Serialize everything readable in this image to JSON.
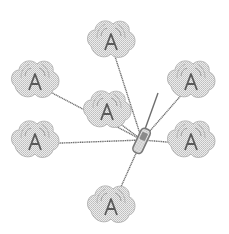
{
  "diagram": {
    "type": "star-network",
    "colors": {
      "background": "#ffffff",
      "line": "#6e6e6e",
      "node_fill": "#d4d4d4",
      "node_stroke": "#a8a8a8",
      "antenna": "#5a5a5a",
      "hub": "#7a7a7a"
    },
    "hub": {
      "name": "wireless-handset",
      "x": 142,
      "y": 140,
      "antenna_tip": {
        "x": 158,
        "y": 93
      }
    },
    "nodes": [
      {
        "id": "ap-top",
        "icon": "wireless-access-point",
        "glyph": "A",
        "x": 111,
        "y": 40,
        "connected": true
      },
      {
        "id": "ap-upper-left",
        "icon": "wireless-access-point",
        "glyph": "A",
        "x": 35,
        "y": 80,
        "connected": true
      },
      {
        "id": "ap-middle",
        "icon": "wireless-access-point",
        "glyph": "A",
        "x": 107,
        "y": 110,
        "connected": true
      },
      {
        "id": "ap-upper-right",
        "icon": "wireless-access-point",
        "glyph": "A",
        "x": 191,
        "y": 80,
        "connected": true
      },
      {
        "id": "ap-lower-left",
        "icon": "wireless-access-point",
        "glyph": "A",
        "x": 35,
        "y": 140,
        "connected": true
      },
      {
        "id": "ap-lower-right",
        "icon": "wireless-access-point",
        "glyph": "A",
        "x": 191,
        "y": 140,
        "connected": true
      },
      {
        "id": "ap-bottom",
        "icon": "wireless-access-point",
        "glyph": "A",
        "x": 111,
        "y": 205,
        "connected": true
      }
    ]
  }
}
